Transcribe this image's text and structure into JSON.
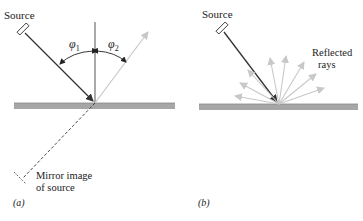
{
  "panel_a": {
    "source_label": "Source",
    "phi1_label": "φ",
    "phi1_sub": "1",
    "phi2_label": "φ",
    "phi2_sub": "2",
    "mirror_image_line1": "Mirror image",
    "mirror_image_line2": "of source",
    "panel_label": "(a)"
  },
  "panel_b": {
    "source_label": "Source",
    "reflected_line1": "Reflected",
    "reflected_line2": "rays",
    "panel_label": "(b)"
  },
  "colors": {
    "incident_ray": "#333333",
    "reflected_ray": "#c8c8c8",
    "surface": "#a6a6a6",
    "normal": "#555555"
  }
}
